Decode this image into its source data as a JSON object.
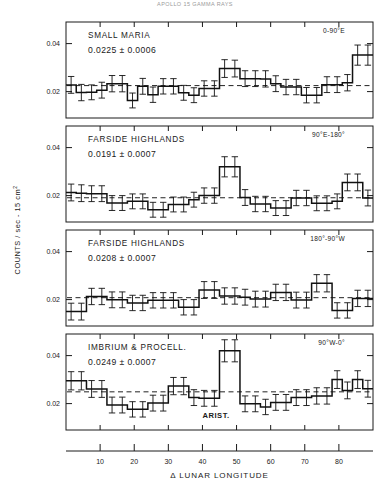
{
  "figure": {
    "top_caption": "APOLLO 15 GAMMA RAYS",
    "y_axis_label": "COUNTS / sec - 15 cm",
    "y_axis_label_sup": "2",
    "x_axis_label": "Δ LUNAR LONGITUDE"
  },
  "chart_data": {
    "type": "bar",
    "title": "APOLLO 15 GAMMA RAYS",
    "xlabel": "Δ LUNAR LONGITUDE",
    "ylabel": "COUNTS / sec - 15 cm2",
    "xlim": [
      0,
      90
    ],
    "ylim": [
      0.009,
      0.049
    ],
    "xticks": [
      10,
      20,
      30,
      40,
      50,
      60,
      70,
      80
    ],
    "xtick_labels": [
      "10",
      "20",
      "30",
      "40",
      "50",
      "60",
      "70",
      "80"
    ],
    "yticks": [
      0.02,
      0.04
    ],
    "ytick_labels": [
      "0.02",
      "0.04"
    ],
    "grid": false,
    "legend": "none",
    "bin_width": 3,
    "bin_centers": [
      1.5,
      4.5,
      7.5,
      10.5,
      13.5,
      16.5,
      19.5,
      22.5,
      25.5,
      28.5,
      31.5,
      34.5,
      37.5,
      40.5,
      43.5,
      46.5,
      49.5,
      52.5,
      55.5,
      58.5,
      61.5,
      64.5,
      67.5,
      70.5,
      73.5,
      76.5,
      79.5,
      82.5,
      85.5,
      88.5
    ],
    "panels": [
      {
        "id": "small-maria",
        "title": "SMALL MARIA",
        "mean_label": "0.0225 ± 0.0006",
        "mean": 0.0225,
        "mean_error": 0.0006,
        "range_label": "0-90°E",
        "values": [
          0.0228,
          0.0196,
          0.0197,
          0.0206,
          0.0233,
          0.0233,
          0.0163,
          0.0222,
          0.0187,
          0.0222,
          0.0222,
          0.0195,
          0.0185,
          0.0213,
          0.0213,
          0.0296,
          0.0296,
          0.0254,
          0.0254,
          0.0253,
          0.0233,
          0.0219,
          0.0219,
          0.0185,
          0.0185,
          0.0229,
          0.0229,
          0.0237,
          0.0352,
          0.0352
        ],
        "errors": [
          0.0035,
          0.0034,
          0.0031,
          0.0033,
          0.0034,
          0.0034,
          0.0031,
          0.0033,
          0.0032,
          0.0032,
          0.0032,
          0.0031,
          0.0031,
          0.0032,
          0.0032,
          0.0037,
          0.0035,
          0.0033,
          0.0033,
          0.0034,
          0.0033,
          0.0032,
          0.0032,
          0.0032,
          0.0032,
          0.0033,
          0.0033,
          0.0034,
          0.0042,
          0.0042
        ]
      },
      {
        "id": "farside-highlands-east",
        "title": "FARSIDE HIGHLANDS",
        "mean_label": "0.0191 ± 0.0007",
        "mean": 0.0191,
        "mean_error": 0.0007,
        "range_label": "90°E-180°",
        "values": [
          0.0213,
          0.021,
          0.0208,
          0.0208,
          0.0169,
          0.0169,
          0.0176,
          0.0176,
          0.0141,
          0.0141,
          0.0163,
          0.0163,
          0.0183,
          0.02,
          0.02,
          0.032,
          0.032,
          0.0192,
          0.0165,
          0.0165,
          0.0148,
          0.0148,
          0.019,
          0.019,
          0.0168,
          0.0168,
          0.0176,
          0.0255,
          0.0255,
          0.019
        ],
        "errors": [
          0.0035,
          0.0035,
          0.0033,
          0.0033,
          0.0031,
          0.0031,
          0.0031,
          0.0031,
          0.0031,
          0.0031,
          0.0031,
          0.0031,
          0.0031,
          0.0032,
          0.0032,
          0.0042,
          0.0042,
          0.0033,
          0.0032,
          0.0032,
          0.0031,
          0.0031,
          0.0032,
          0.0032,
          0.0031,
          0.0031,
          0.0031,
          0.0035,
          0.0035,
          0.0033
        ]
      },
      {
        "id": "farside-highlands-west",
        "title": "FARSIDE HIGHLANDS",
        "mean_label": "0.0208 ± 0.0007",
        "mean": 0.0208,
        "mean_error": 0.0007,
        "range_label": "180°-90°W",
        "values": [
          0.015,
          0.015,
          0.0213,
          0.0213,
          0.0199,
          0.0199,
          0.0186,
          0.0186,
          0.0197,
          0.0197,
          0.0197,
          0.0168,
          0.0168,
          0.024,
          0.024,
          0.0215,
          0.0215,
          0.021,
          0.0202,
          0.0202,
          0.023,
          0.023,
          0.0198,
          0.0198,
          0.0268,
          0.0268,
          0.0155,
          0.0155,
          0.0205,
          0.0205
        ],
        "errors": [
          0.0035,
          0.0035,
          0.0034,
          0.0034,
          0.0033,
          0.0033,
          0.0032,
          0.0032,
          0.0032,
          0.0032,
          0.0032,
          0.0032,
          0.0032,
          0.0035,
          0.0035,
          0.0034,
          0.0034,
          0.0033,
          0.0033,
          0.0033,
          0.0034,
          0.0034,
          0.0033,
          0.0033,
          0.0036,
          0.0036,
          0.0032,
          0.0032,
          0.0034,
          0.0034
        ]
      },
      {
        "id": "imbrium-procellarum",
        "title": "IMBRIUM & PROCELL.",
        "mean_label": "0.0249 ± 0.0007",
        "mean": 0.0249,
        "mean_error": 0.0007,
        "range_label": "90°W-0°",
        "annotation": "ARIST.",
        "annotation_x": 44,
        "values": [
          0.0295,
          0.0295,
          0.0261,
          0.0261,
          0.0194,
          0.0194,
          0.0176,
          0.0176,
          0.0202,
          0.0202,
          0.0273,
          0.0273,
          0.0225,
          0.0222,
          0.0222,
          0.042,
          0.042,
          0.0199,
          0.0199,
          0.0186,
          0.0205,
          0.0205,
          0.0225,
          0.0225,
          0.0232,
          0.0232,
          0.03,
          0.0255,
          0.03,
          0.0262
        ],
        "errors": [
          0.0038,
          0.0038,
          0.0035,
          0.0035,
          0.0033,
          0.0033,
          0.0032,
          0.0032,
          0.0033,
          0.0033,
          0.0036,
          0.0036,
          0.0033,
          0.0033,
          0.0033,
          0.0046,
          0.0046,
          0.0033,
          0.0033,
          0.0032,
          0.0033,
          0.0033,
          0.0033,
          0.0033,
          0.0034,
          0.0034,
          0.0037,
          0.0035,
          0.0037,
          0.0035
        ]
      }
    ]
  }
}
